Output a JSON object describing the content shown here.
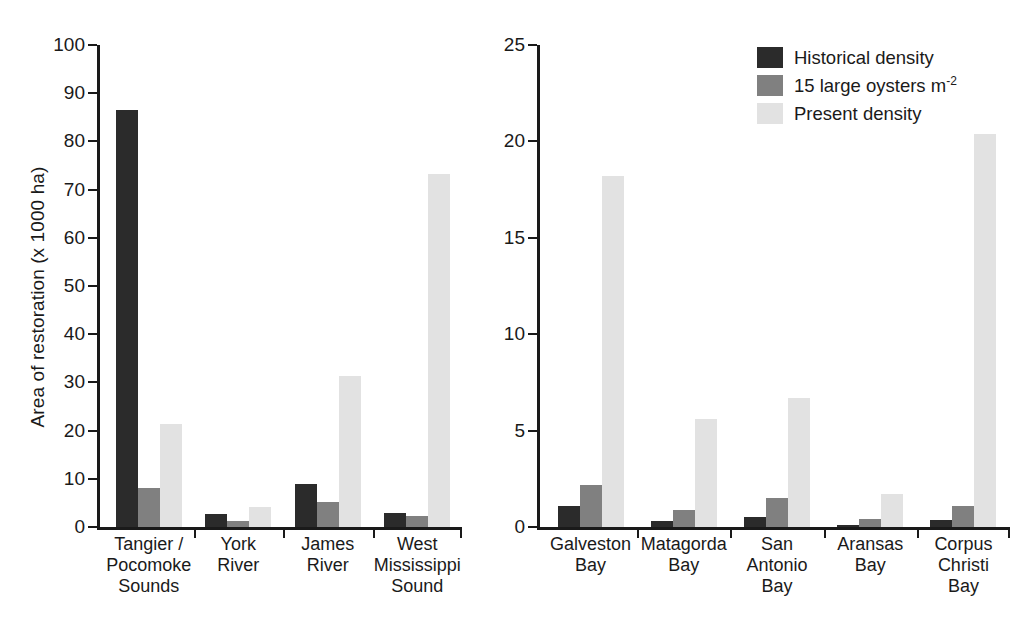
{
  "chart_data": {
    "type": "bar",
    "title": "",
    "xlabel": "",
    "ylabel": "Area of restoration (x 1000 ha)",
    "grid": false,
    "legend_position": "top-right",
    "legend": [
      {
        "name": "Historical density",
        "color": "#2b2b2b"
      },
      {
        "name": "15 large oysters m",
        "superscript": "-2",
        "color": "#808080"
      },
      {
        "name": "Present density",
        "color": "#e2e2e2"
      }
    ],
    "panels": [
      {
        "id": "left-panel",
        "ylim": [
          0,
          100
        ],
        "yticks": [
          0,
          10,
          20,
          30,
          40,
          50,
          60,
          70,
          80,
          90,
          100
        ],
        "categories": [
          "Tangier /\nPocomoke\nSounds",
          "York\nRiver",
          "James\nRiver",
          "West\nMississippi\nSound"
        ],
        "series": [
          {
            "name": "Historical density",
            "values": [
              86.6,
              2.8,
              8.9,
              2.9
            ]
          },
          {
            "name": "15 large oysters m-2",
            "values": [
              8.0,
              1.3,
              5.2,
              2.2
            ]
          },
          {
            "name": "Present density",
            "values": [
              21.4,
              4.2,
              31.4,
              73.2
            ]
          }
        ]
      },
      {
        "id": "right-panel",
        "ylim": [
          0,
          25
        ],
        "yticks": [
          0,
          5,
          10,
          15,
          20,
          25
        ],
        "categories": [
          "Galveston\nBay",
          "Matagorda\nBay",
          "San\nAntonio\nBay",
          "Aransas\nBay",
          "Corpus\nChristi\nBay"
        ],
        "series": [
          {
            "name": "Historical density",
            "values": [
              1.1,
              0.3,
              0.5,
              0.12,
              0.35
            ]
          },
          {
            "name": "15 large oysters m-2",
            "values": [
              2.2,
              0.9,
              1.5,
              0.42,
              1.1
            ]
          },
          {
            "name": "Present density",
            "values": [
              18.2,
              5.6,
              6.7,
              1.7,
              20.4
            ]
          }
        ]
      }
    ]
  }
}
